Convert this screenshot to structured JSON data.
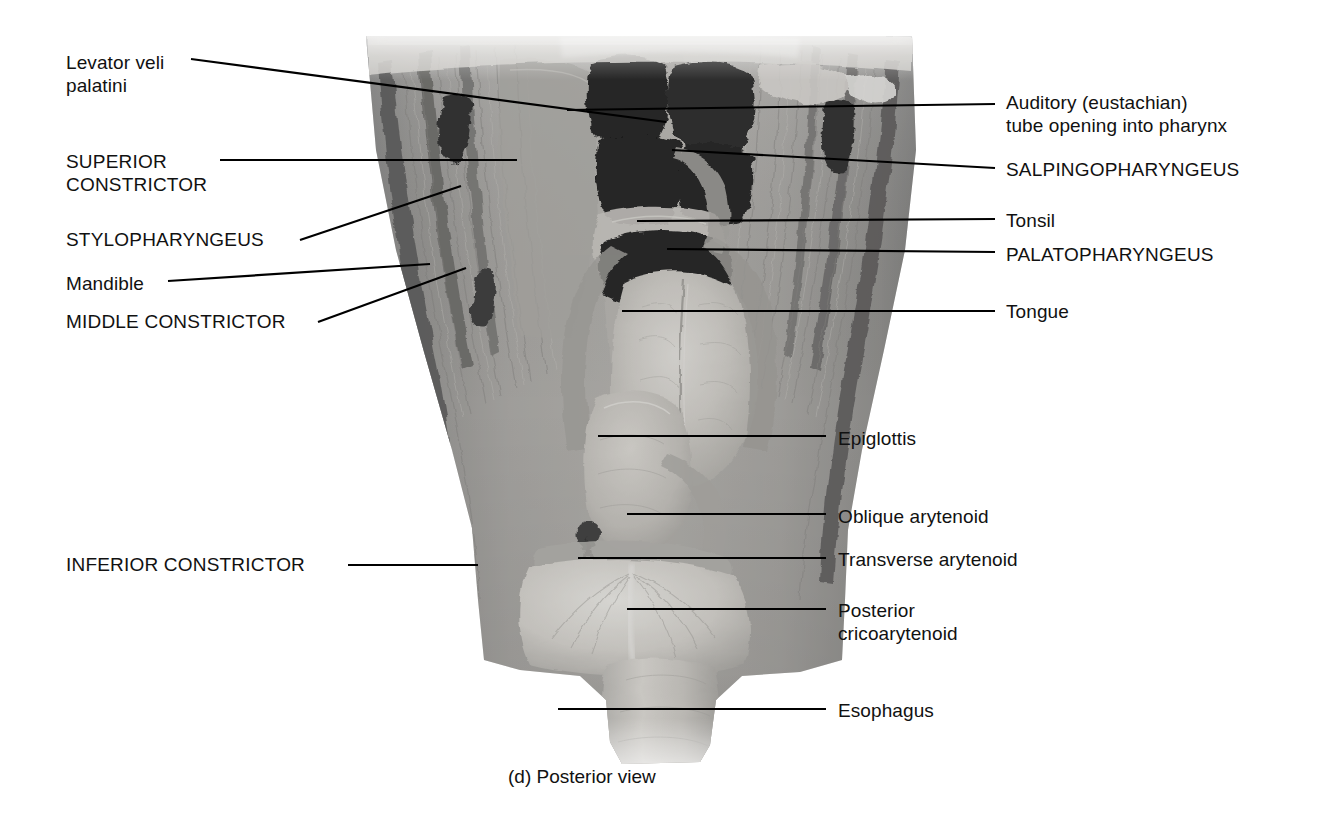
{
  "figure": {
    "caption": "(d) Posterior view",
    "view_label": "Posterior view",
    "panel_letter": "(d)",
    "background_color": "#ffffff",
    "text_color": "#111111",
    "leader_color": "#000000",
    "image_type": "grayscale cadaver dissection photograph"
  },
  "labels_left": [
    {
      "id": "levator-veli-palatini",
      "text": "Levator veli\npalatini",
      "style": "title-case",
      "x": 66,
      "y": 51
    },
    {
      "id": "superior-constrictor",
      "text": "SUPERIOR\nCONSTRICTOR",
      "style": "uppercase",
      "x": 66,
      "y": 150
    },
    {
      "id": "stylopharyngeus",
      "text": "STYLOPHARYNGEUS",
      "style": "uppercase",
      "x": 66,
      "y": 228
    },
    {
      "id": "mandible",
      "text": "Mandible",
      "style": "title-case",
      "x": 66,
      "y": 272
    },
    {
      "id": "middle-constrictor",
      "text": "MIDDLE CONSTRICTOR",
      "style": "uppercase",
      "x": 66,
      "y": 310
    },
    {
      "id": "inferior-constrictor",
      "text": "INFERIOR CONSTRICTOR",
      "style": "uppercase",
      "x": 66,
      "y": 553
    }
  ],
  "labels_right": [
    {
      "id": "auditory-tube-opening",
      "text": "Auditory (eustachian)\ntube opening into pharynx",
      "style": "title-case",
      "x": 1006,
      "y": 91
    },
    {
      "id": "salpingopharyngeus",
      "text": "SALPINGOPHARYNGEUS",
      "style": "uppercase",
      "x": 1006,
      "y": 158
    },
    {
      "id": "tonsil",
      "text": "Tonsil",
      "style": "title-case",
      "x": 1006,
      "y": 209
    },
    {
      "id": "palatopharyngeus",
      "text": "PALATOPHARYNGEUS",
      "style": "uppercase",
      "x": 1006,
      "y": 243
    },
    {
      "id": "tongue",
      "text": "Tongue",
      "style": "title-case",
      "x": 1006,
      "y": 300
    },
    {
      "id": "epiglottis",
      "text": "Epiglottis",
      "style": "title-case",
      "x": 838,
      "y": 427
    },
    {
      "id": "oblique-arytenoid",
      "text": "Oblique arytenoid",
      "style": "title-case",
      "x": 838,
      "y": 505
    },
    {
      "id": "transverse-arytenoid",
      "text": "Transverse arytenoid",
      "style": "title-case",
      "x": 838,
      "y": 548
    },
    {
      "id": "posterior-cricoarytenoid",
      "text": "Posterior\ncricoarytenoid",
      "style": "title-case",
      "x": 838,
      "y": 599
    },
    {
      "id": "esophagus",
      "text": "Esophagus",
      "style": "title-case",
      "x": 838,
      "y": 699
    }
  ],
  "leader_lines": [
    {
      "id": "leader-levator-veli-palatini",
      "x1": 191,
      "y1": 59,
      "x2": 666,
      "y2": 122
    },
    {
      "id": "leader-superior-constrictor",
      "x1": 220,
      "y1": 160,
      "x2": 517,
      "y2": 160
    },
    {
      "id": "leader-stylopharyngeus",
      "x1": 300,
      "y1": 240,
      "x2": 461,
      "y2": 186
    },
    {
      "id": "leader-mandible",
      "x1": 168,
      "y1": 281,
      "x2": 430,
      "y2": 264
    },
    {
      "id": "leader-middle-constrictor",
      "x1": 318,
      "y1": 322,
      "x2": 466,
      "y2": 268
    },
    {
      "id": "leader-inferior-constrictor",
      "x1": 348,
      "y1": 565,
      "x2": 478,
      "y2": 565
    },
    {
      "id": "leader-auditory-tube",
      "x1": 995,
      "y1": 104,
      "x2": 567,
      "y2": 110
    },
    {
      "id": "leader-salpingopharyngeus",
      "x1": 995,
      "y1": 168,
      "x2": 672,
      "y2": 150
    },
    {
      "id": "leader-tonsil",
      "x1": 995,
      "y1": 219,
      "x2": 637,
      "y2": 221
    },
    {
      "id": "leader-palatopharyngeus",
      "x1": 995,
      "y1": 252,
      "x2": 667,
      "y2": 249
    },
    {
      "id": "leader-tongue",
      "x1": 995,
      "y1": 311,
      "x2": 622,
      "y2": 311
    },
    {
      "id": "leader-epiglottis",
      "x1": 826,
      "y1": 436,
      "x2": 598,
      "y2": 436
    },
    {
      "id": "leader-oblique-arytenoid",
      "x1": 826,
      "y1": 514,
      "x2": 627,
      "y2": 514
    },
    {
      "id": "leader-transverse-arytenoid",
      "x1": 826,
      "y1": 558,
      "x2": 578,
      "y2": 558
    },
    {
      "id": "leader-posterior-cricoarytenoid",
      "x1": 826,
      "y1": 609,
      "x2": 627,
      "y2": 609
    },
    {
      "id": "leader-esophagus",
      "x1": 826,
      "y1": 709,
      "x2": 558,
      "y2": 709
    }
  ]
}
